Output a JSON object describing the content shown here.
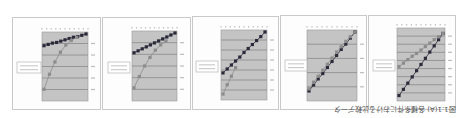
{
  "figure": {
    "caption": "図1.1(A) 各種条件における比較データ",
    "orientation_note": "rotated 180 degrees",
    "colors": {
      "plot_bg": "#c4c4c4",
      "gridline": "#8a8a8a",
      "series_dark": "#2a2a3a",
      "series_light": "#8c8c8c",
      "border": "#c9c9c9"
    }
  },
  "chart_data": [
    {
      "type": "line",
      "title": "",
      "panel": 1,
      "series": [
        {
          "name": "series-dark",
          "x": [
            0,
            0.1,
            0.2,
            0.3,
            0.4,
            0.5,
            0.6,
            0.7,
            0.8,
            0.9,
            1.0
          ],
          "y": [
            0.82,
            0.84,
            0.86,
            0.87,
            0.89,
            0.91,
            0.93,
            0.95,
            0.96,
            0.98,
            1.0
          ]
        },
        {
          "name": "series-light",
          "x": [
            0,
            0.13,
            0.26,
            0.39,
            0.52,
            0.65,
            0.78
          ],
          "y": [
            0.15,
            0.38,
            0.57,
            0.72,
            0.83,
            0.9,
            0.95
          ]
        }
      ],
      "gridlines": 6,
      "legend_position": "left",
      "ylim": [
        0,
        1
      ]
    },
    {
      "type": "line",
      "title": "",
      "panel": 2,
      "series": [
        {
          "name": "series-dark",
          "x": [
            0,
            0.1,
            0.2,
            0.3,
            0.4,
            0.5,
            0.6,
            0.7,
            0.8,
            0.9,
            1.0
          ],
          "y": [
            0.7,
            0.73,
            0.76,
            0.79,
            0.82,
            0.85,
            0.88,
            0.91,
            0.94,
            0.97,
            1.0
          ]
        },
        {
          "name": "series-light",
          "x": [
            0,
            0.13,
            0.26,
            0.39,
            0.52,
            0.65,
            0.78
          ],
          "y": [
            0.17,
            0.34,
            0.5,
            0.63,
            0.74,
            0.82,
            0.88
          ]
        }
      ],
      "gridlines": 6,
      "legend_position": "left",
      "ylim": [
        0,
        1
      ]
    },
    {
      "type": "line",
      "title": "",
      "panel": 3,
      "series": [
        {
          "name": "series-dark",
          "x": [
            0,
            0.1,
            0.2,
            0.3,
            0.4,
            0.5,
            0.6,
            0.7,
            0.8,
            0.9,
            1.0
          ],
          "y": [
            0.38,
            0.44,
            0.5,
            0.56,
            0.62,
            0.69,
            0.75,
            0.81,
            0.87,
            0.93,
            1.0
          ]
        },
        {
          "name": "series-light",
          "x": [
            0,
            0.1,
            0.2,
            0.3
          ],
          "y": [
            0.06,
            0.2,
            0.33,
            0.46
          ]
        }
      ],
      "gridlines": 7,
      "legend_position": "left",
      "ylim": [
        0,
        1
      ]
    },
    {
      "type": "line",
      "title": "",
      "panel": 4,
      "series": [
        {
          "name": "series-dark",
          "x": [
            0,
            0.1,
            0.2,
            0.3,
            0.4,
            0.5,
            0.6,
            0.7,
            0.8,
            0.9,
            1.0
          ],
          "y": [
            0.12,
            0.21,
            0.3,
            0.38,
            0.47,
            0.56,
            0.65,
            0.74,
            0.82,
            0.91,
            1.0
          ]
        },
        {
          "name": "series-light",
          "x": [
            0,
            0.1,
            0.2,
            0.3,
            0.4,
            0.5,
            0.6,
            0.7,
            0.8,
            0.9,
            1.0
          ],
          "y": [
            0.15,
            0.25,
            0.34,
            0.43,
            0.52,
            0.61,
            0.7,
            0.78,
            0.86,
            0.93,
            1.0
          ]
        }
      ],
      "gridlines": 5,
      "legend_position": "left",
      "ylim": [
        0,
        1
      ]
    },
    {
      "type": "line",
      "title": "",
      "panel": 5,
      "series": [
        {
          "name": "series-dark",
          "x": [
            0,
            0.1,
            0.2,
            0.3,
            0.4,
            0.5,
            0.6,
            0.7,
            0.8,
            0.9,
            1.0
          ],
          "y": [
            0.05,
            0.14,
            0.23,
            0.32,
            0.41,
            0.5,
            0.59,
            0.68,
            0.77,
            0.86,
            0.95
          ]
        },
        {
          "name": "series-light",
          "x": [
            0,
            0.1,
            0.2,
            0.3,
            0.4,
            0.5,
            0.6,
            0.7,
            0.8,
            0.9,
            1.0
          ],
          "y": [
            0.47,
            0.52,
            0.57,
            0.62,
            0.66,
            0.71,
            0.76,
            0.81,
            0.86,
            0.9,
            0.95
          ]
        }
      ],
      "gridlines": 9,
      "legend_position": "left",
      "ylim": [
        0,
        1
      ]
    }
  ],
  "layout": {
    "panels": [
      {
        "x": 12,
        "y": 17,
        "w": 89,
        "h": 93,
        "plot": {
          "x": 29,
          "y": 14,
          "w": 46,
          "h": 69
        },
        "legend": {
          "x": 4,
          "y": 44,
          "w": 24,
          "h": 11
        }
      },
      {
        "x": 102,
        "y": 17,
        "w": 89,
        "h": 93,
        "plot": {
          "x": 29,
          "y": 13,
          "w": 45,
          "h": 70
        },
        "legend": {
          "x": 5,
          "y": 44,
          "w": 22,
          "h": 11
        }
      },
      {
        "x": 192,
        "y": 16,
        "w": 87,
        "h": 94,
        "plot": {
          "x": 28,
          "y": 13,
          "w": 46,
          "h": 70
        },
        "legend": {
          "x": 3,
          "y": 44,
          "w": 22,
          "h": 11
        }
      },
      {
        "x": 280,
        "y": 15,
        "w": 87,
        "h": 95,
        "plot": {
          "x": 26,
          "y": 14,
          "w": 50,
          "h": 71
        },
        "legend": {
          "x": 4,
          "y": 44,
          "w": 22,
          "h": 11
        }
      },
      {
        "x": 368,
        "y": 15,
        "w": 88,
        "h": 95,
        "plot": {
          "x": 28,
          "y": 12,
          "w": 48,
          "h": 73
        },
        "legend": {
          "x": 4,
          "y": 44,
          "w": 22,
          "h": 11
        }
      }
    ]
  }
}
